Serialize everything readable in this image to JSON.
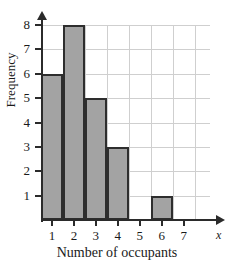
{
  "chart_data": {
    "type": "bar",
    "title": "",
    "xlabel": "Number of occupants",
    "ylabel": "Frequency",
    "axis_name_x": "x",
    "categories": [
      "1",
      "2",
      "3",
      "4",
      "5",
      "6",
      "7"
    ],
    "values": [
      6,
      8,
      5,
      3,
      0,
      1,
      0
    ],
    "xlim": [
      0.5,
      7.5
    ],
    "ylim": [
      0,
      8
    ],
    "x_ticks": [
      "1",
      "2",
      "3",
      "4",
      "5",
      "6",
      "7"
    ],
    "y_ticks": [
      "1",
      "2",
      "3",
      "4",
      "5",
      "6",
      "7",
      "8"
    ],
    "grid": true,
    "legend": "none",
    "bar_fill_color": "#a3a3a3",
    "bar_edge_color": "#2e2e2e",
    "grid_color": "#cfcfcf",
    "axis_color": "#2b2b2b"
  }
}
